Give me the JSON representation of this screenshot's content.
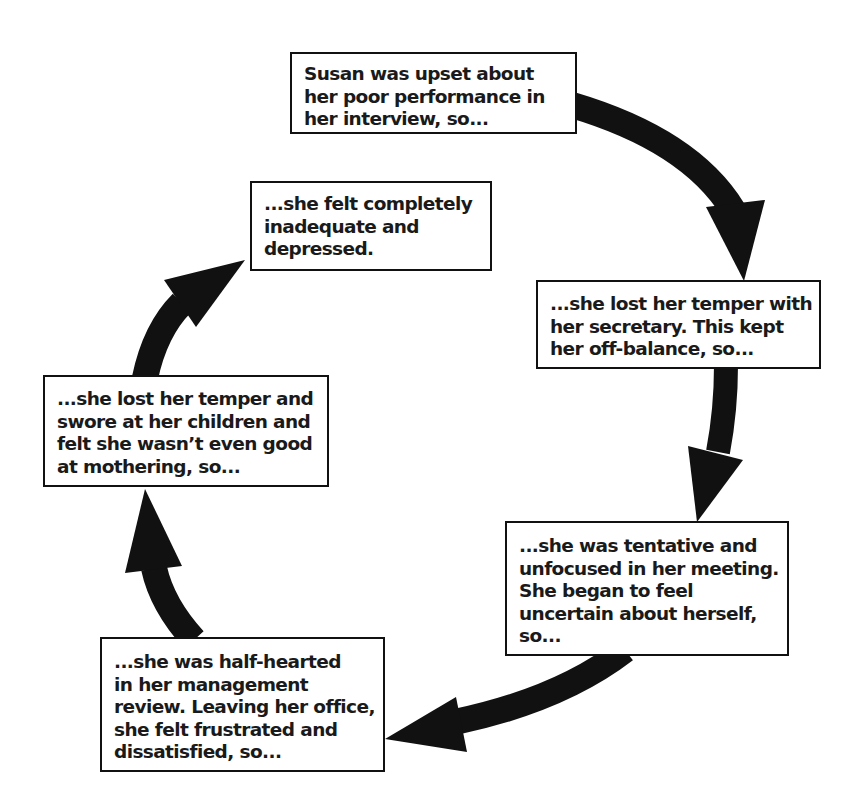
{
  "diagram": {
    "type": "cycle",
    "colors": {
      "arrow": "#111111",
      "box_border": "#111111",
      "box_fill": "#ffffff",
      "text": "#1a1a1a"
    },
    "steps": [
      {
        "id": "step-1",
        "lines": [
          "Susan was upset about",
          "her poor performance in",
          "her interview, so..."
        ]
      },
      {
        "id": "step-2",
        "lines": [
          "...she lost her temper with",
          "her secretary. This kept",
          "her off-balance, so..."
        ]
      },
      {
        "id": "step-3",
        "lines": [
          "...she was tentative and",
          "unfocused in her meeting.",
          "She began to feel",
          "uncertain about herself,",
          "so..."
        ]
      },
      {
        "id": "step-4",
        "lines": [
          "...she was half-hearted",
          "in her management",
          "review. Leaving her office,",
          "she felt frustrated and",
          "dissatisfied, so..."
        ]
      },
      {
        "id": "step-5",
        "lines": [
          "...she lost her temper and",
          "swore at her children and",
          "felt she wasn’t even good",
          "at mothering, so..."
        ]
      },
      {
        "id": "step-6",
        "lines": [
          "...she felt completely",
          "inadequate and",
          "depressed."
        ]
      }
    ],
    "arrows": [
      {
        "from": "step-1",
        "to": "step-2"
      },
      {
        "from": "step-2",
        "to": "step-3"
      },
      {
        "from": "step-3",
        "to": "step-4"
      },
      {
        "from": "step-4",
        "to": "step-5"
      },
      {
        "from": "step-5",
        "to": "step-6"
      }
    ]
  }
}
